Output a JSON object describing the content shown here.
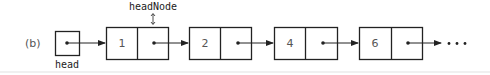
{
  "figure": {
    "label": "(b)",
    "head_pointer": {
      "label": "head"
    },
    "head_node_label": "headNode",
    "nodes": [
      {
        "value": "1"
      },
      {
        "value": "2"
      },
      {
        "value": "4"
      },
      {
        "value": "6"
      }
    ],
    "continuation": "• • •",
    "colors": {
      "stroke": "#222222",
      "text": "#555555",
      "background": "#ffffff"
    }
  }
}
